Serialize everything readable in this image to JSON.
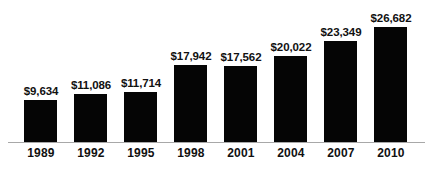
{
  "chart_data": {
    "type": "bar",
    "title": "",
    "subtitle": "",
    "xlabel": "",
    "ylabel": "",
    "categories": [
      "1989",
      "1992",
      "1995",
      "1998",
      "2001",
      "2004",
      "2007",
      "2010"
    ],
    "values": [
      9634,
      11086,
      11714,
      17942,
      17562,
      20022,
      23349,
      26682
    ],
    "value_labels": [
      "$9,634",
      "$11,086",
      "$11,714",
      "$17,942",
      "$17,562",
      "$20,022",
      "$23,349",
      "$26,682"
    ],
    "ylim": [
      0,
      28000
    ],
    "grid": false,
    "legend": null,
    "bar_color": "#050505",
    "axis_color": "#a8a8a8",
    "background_color": "#ffffff",
    "text_color": "#111111",
    "bars": [
      {
        "category": "1989",
        "value": 9634,
        "label": "$9,634"
      },
      {
        "category": "1992",
        "value": 11086,
        "label": "$11,086"
      },
      {
        "category": "1995",
        "value": 11714,
        "label": "$11,714"
      },
      {
        "category": "1998",
        "value": 17942,
        "label": "$17,942"
      },
      {
        "category": "2001",
        "value": 17562,
        "label": "$17,562"
      },
      {
        "category": "2004",
        "value": 20022,
        "label": "$20,022"
      },
      {
        "category": "2007",
        "value": 23349,
        "label": "$23,349"
      },
      {
        "category": "2010",
        "value": 26682,
        "label": "$26,682"
      }
    ]
  }
}
